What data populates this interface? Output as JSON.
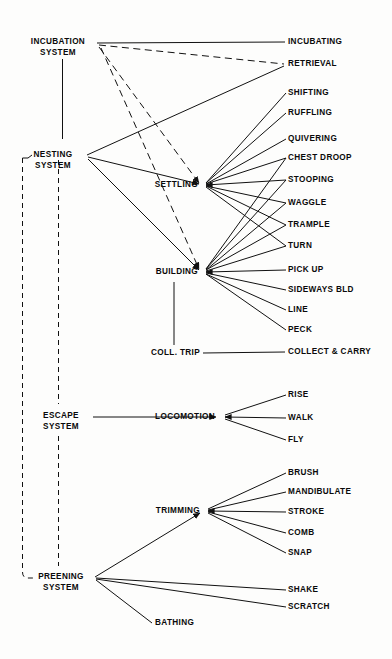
{
  "diagram": {
    "type": "hierarchical-tree",
    "title": "",
    "systems": [
      {
        "id": "incubation",
        "line1": "INCUBATION",
        "line2": "SYSTEM"
      },
      {
        "id": "nesting",
        "line1": "NESTING",
        "line2": "SYSTEM"
      },
      {
        "id": "escape",
        "line1": "ESCAPE",
        "line2": "SYSTEM"
      },
      {
        "id": "preening",
        "line1": "PREENING",
        "line2": "SYSTEM"
      }
    ],
    "subsystems": [
      {
        "id": "settling",
        "label": "SETTLING"
      },
      {
        "id": "building",
        "label": "BUILDING"
      },
      {
        "id": "colltrip",
        "label": "COLL. TRIP"
      },
      {
        "id": "locomotion",
        "label": "LOCOMOTION"
      },
      {
        "id": "trimming",
        "label": "TRIMMING"
      },
      {
        "id": "bathing",
        "label": "BATHING"
      }
    ],
    "acts": [
      {
        "id": "incubating",
        "label": "INCUBATING"
      },
      {
        "id": "retrieval",
        "label": "RETRIEVAL"
      },
      {
        "id": "shifting",
        "label": "SHIFTING"
      },
      {
        "id": "ruffling",
        "label": "RUFFLING"
      },
      {
        "id": "quivering",
        "label": "QUIVERING"
      },
      {
        "id": "chest-droop",
        "label": "CHEST  DROOP"
      },
      {
        "id": "stooping",
        "label": "STOOPING"
      },
      {
        "id": "waggle",
        "label": "WAGGLE"
      },
      {
        "id": "trample",
        "label": "TRAMPLE"
      },
      {
        "id": "turn",
        "label": "TURN"
      },
      {
        "id": "pick-up",
        "label": "PICK UP"
      },
      {
        "id": "sideways-bld",
        "label": "SIDEWAYS  BLD"
      },
      {
        "id": "line",
        "label": "LINE"
      },
      {
        "id": "peck",
        "label": "PECK"
      },
      {
        "id": "collect-carry",
        "label": "COLLECT & CARRY"
      },
      {
        "id": "rise",
        "label": "RISE"
      },
      {
        "id": "walk",
        "label": "WALK"
      },
      {
        "id": "fly",
        "label": "FLY"
      },
      {
        "id": "brush",
        "label": "BRUSH"
      },
      {
        "id": "mandibulate",
        "label": "MANDIBULATE"
      },
      {
        "id": "stroke",
        "label": "STROKE"
      },
      {
        "id": "comb",
        "label": "COMB"
      },
      {
        "id": "snap",
        "label": "SNAP"
      },
      {
        "id": "shake",
        "label": "SHAKE"
      },
      {
        "id": "scratch",
        "label": "SCRATCH"
      }
    ],
    "colors": {
      "line": "#111111",
      "text": "#0a0a0a",
      "background": "#fdfdfc"
    }
  }
}
